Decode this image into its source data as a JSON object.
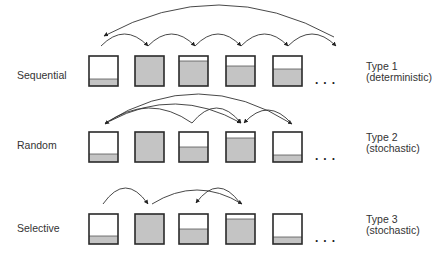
{
  "colors": {
    "stroke": "#2a2a2a",
    "fill": "#c4c4c4",
    "text": "#333333",
    "arrow": "#333333"
  },
  "box": {
    "width": 29,
    "height": 30,
    "x": [
      89,
      135,
      179,
      226,
      273
    ]
  },
  "rows": [
    {
      "name": "sequential",
      "label": "Sequential",
      "type_title": "Type 1",
      "type_sub": "(deterministic)",
      "ellipsis": "...",
      "box_top": 56,
      "fill_levels": [
        0.23,
        1.0,
        0.82,
        0.65,
        0.58
      ],
      "arrows": [
        {
          "from": [
            101,
            46
          ],
          "to": [
            148,
            46
          ],
          "peak": 34,
          "head": "end"
        },
        {
          "from": [
            148,
            46
          ],
          "to": [
            195,
            46
          ],
          "peak": 34,
          "head": "end"
        },
        {
          "from": [
            195,
            46
          ],
          "to": [
            241,
            46
          ],
          "peak": 34,
          "head": "end"
        },
        {
          "from": [
            241,
            46
          ],
          "to": [
            288,
            46
          ],
          "peak": 34,
          "head": "end"
        },
        {
          "from": [
            288,
            46
          ],
          "to": [
            336,
            46
          ],
          "peak": 34,
          "head": "end"
        },
        {
          "from": [
            334,
            37
          ],
          "to": [
            104,
            36
          ],
          "peak": 5,
          "head": "end"
        }
      ]
    },
    {
      "name": "random",
      "label": "Random",
      "type_title": "Type 2",
      "type_sub": "(stochastic)",
      "ellipsis": "...",
      "box_top": 132,
      "fill_levels": [
        0.25,
        1.0,
        0.5,
        0.8,
        0.23
      ],
      "arrows": [
        {
          "from": [
            192,
            123
          ],
          "to": [
            105,
            124
          ],
          "peak": 108,
          "head": "end"
        },
        {
          "from": [
            105,
            123
          ],
          "to": [
            292,
            124
          ],
          "peak": 94,
          "head": "end"
        },
        {
          "from": [
            110,
            121
          ],
          "to": [
            241,
            123
          ],
          "peak": 104,
          "head": "end"
        },
        {
          "from": [
            192,
            123
          ],
          "to": [
            241,
            123
          ],
          "peak": 108,
          "head": "end"
        },
        {
          "from": [
            292,
            124
          ],
          "to": [
            244,
            123
          ],
          "peak": 110,
          "head": "end"
        }
      ]
    },
    {
      "name": "selective",
      "label": "Selective",
      "type_title": "Type 3",
      "type_sub": "(stochastic)",
      "ellipsis": "...",
      "box_top": 214,
      "fill_levels": [
        0.25,
        1.0,
        0.5,
        0.82,
        0.22
      ],
      "arrows": [
        {
          "from": [
            103,
            204
          ],
          "to": [
            148,
            204
          ],
          "peak": 188,
          "head": "end"
        },
        {
          "from": [
            152,
            204
          ],
          "to": [
            242,
            204
          ],
          "peak": 190,
          "head": "end"
        },
        {
          "from": [
            240,
            203
          ],
          "to": [
            196,
            203
          ],
          "peak": 188,
          "head": "end"
        }
      ]
    }
  ]
}
